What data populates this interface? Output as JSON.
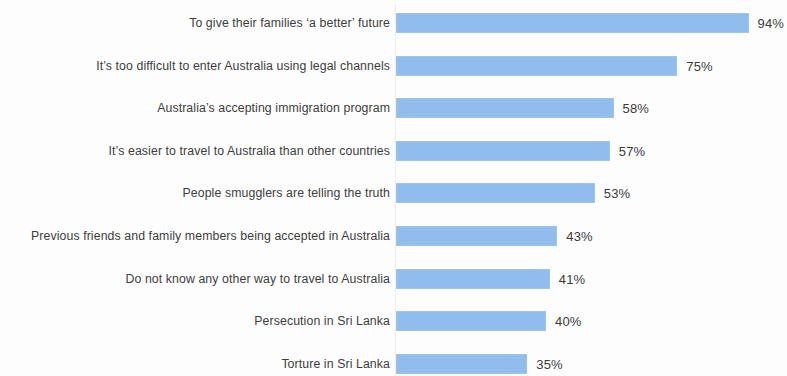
{
  "chart_data": {
    "type": "bar",
    "orientation": "horizontal",
    "title": "",
    "subtitle": "",
    "xlabel": "",
    "ylabel": "",
    "xlim": [
      0,
      100
    ],
    "grid": false,
    "legend": null,
    "value_suffix": "%",
    "bar_color": "#90bdeb",
    "label_color": "#3d3d3d",
    "background_color": "#fdfdfd",
    "categories": [
      "To give their families ‘a better’ future",
      "It’s too difficult to enter Australia using legal channels",
      "Australia’s accepting immigration program",
      "It’s easier to travel to Australia than other countries",
      "People smugglers are telling the truth",
      "Previous friends and family members being accepted in Australia",
      "Do not know any other way to travel to Australia",
      "Persecution in Sri Lanka",
      "Torture in Sri Lanka"
    ],
    "values": [
      94,
      75,
      58,
      57,
      53,
      43,
      41,
      40,
      35
    ],
    "data_labels": [
      "94%",
      "75%",
      "58%",
      "57%",
      "53%",
      "43%",
      "41%",
      "40%",
      "35%"
    ],
    "series": [
      {
        "name": "Share of respondents",
        "values": [
          94,
          75,
          58,
          57,
          53,
          43,
          41,
          40,
          35
        ]
      }
    ]
  }
}
